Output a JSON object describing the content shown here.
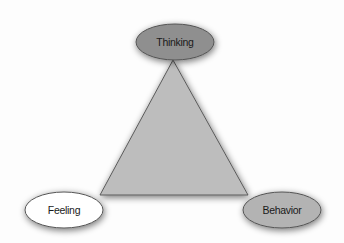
{
  "diagram": {
    "type": "triangle-cycle",
    "center_shape": {
      "shape": "triangle",
      "fill": "#bdbdbd",
      "stroke": "#5a5a5a"
    },
    "nodes": [
      {
        "id": "thinking",
        "label": "Thinking",
        "position": "top",
        "fill": "#8f8f8f"
      },
      {
        "id": "feeling",
        "label": "Feeling",
        "position": "bottom-left",
        "fill": "#ffffff"
      },
      {
        "id": "behavior",
        "label": "Behavior",
        "position": "bottom-right",
        "fill": "#b3b3b3"
      }
    ]
  }
}
